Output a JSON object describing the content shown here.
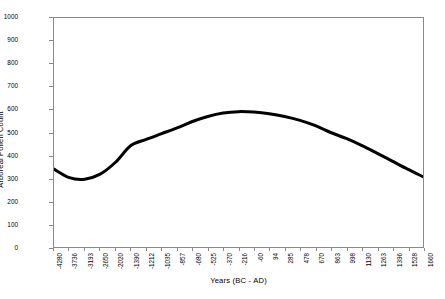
{
  "chart_data": {
    "type": "line",
    "title": "",
    "xlabel": "Years (BC - AD)",
    "ylabel": "Arboreal Pollen Count",
    "ylim": [
      0,
      1000
    ],
    "y_ticks": [
      0,
      100,
      200,
      300,
      400,
      500,
      600,
      700,
      800,
      900,
      1000
    ],
    "grid": false,
    "legend": "none",
    "line_color": "#000000",
    "line_width_px": 3,
    "categories": [
      "-4280",
      "-3736",
      "-3193",
      "-2650",
      "-2020",
      "-1390",
      "-1212",
      "-1035",
      "-857",
      "-680",
      "-525",
      "-370",
      "-216",
      "-60",
      "94",
      "285",
      "478",
      "670",
      "863",
      "998",
      "1130",
      "1263",
      "1396",
      "1528",
      "1660"
    ],
    "series": [
      {
        "name": "Arboreal Pollen Count",
        "values": [
          340,
          303,
          296,
          318,
          370,
          443,
          470,
          495,
          520,
          548,
          570,
          585,
          591,
          589,
          582,
          570,
          553,
          530,
          500,
          474,
          444,
          410,
          375,
          340,
          307
        ]
      }
    ],
    "annotations": []
  },
  "axes": {
    "y_title": "Arboreal Pollen Count",
    "x_title": "Years (BC - AD)"
  }
}
